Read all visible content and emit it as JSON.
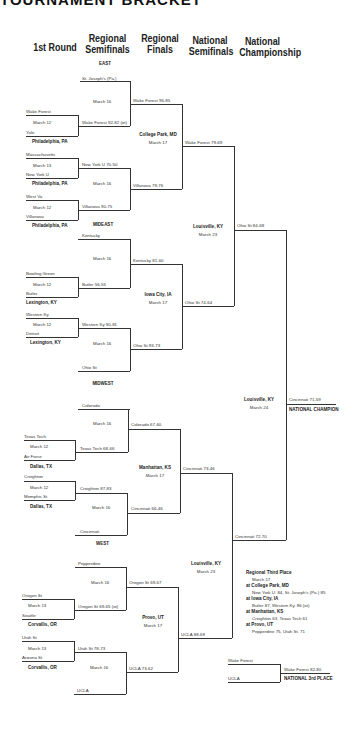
{
  "title": "TOURNAMENT BRACKET",
  "columns": [
    "1st Round",
    "Regional Semifinals",
    "Regional Finals",
    "National Semifinals",
    "National Championship"
  ],
  "regions": {
    "east": "EAST",
    "mideast": "MIDEAST",
    "midwest": "MIDWEST",
    "west": "WEST"
  },
  "first_round": [
    {
      "team1": "Wake Forest",
      "team2": "Yale",
      "date": "March 12",
      "site": "Philadelphia, PA"
    },
    {
      "team1": "Massachusetts",
      "team2": "New York U",
      "date": "March 13",
      "site": "Philadelphia, PA"
    },
    {
      "team1": "West Va",
      "team2": "Villanova",
      "date": "March 12",
      "site": "Philadelphia, PA"
    },
    {
      "team1": "Bowling Green",
      "team2": "Butler",
      "date": "March 12",
      "site": "Lexington, KY"
    },
    {
      "team1": "Western Ky",
      "team2": "Detroit",
      "date": "March 12",
      "site": "Lexington, KY"
    },
    {
      "team1": "Texas Tech",
      "team2": "Air Force",
      "date": "March 12",
      "site": "Dallas, TX"
    },
    {
      "team1": "Creighton",
      "team2": "Memphis St",
      "date": "March 12",
      "site": "Dallas, TX"
    },
    {
      "team1": "Oregon St",
      "team2": "Seattle",
      "date": "March 13",
      "site": "Corvallis, OR"
    },
    {
      "team1": "Utah St",
      "team2": "Arizona St",
      "date": "March 13",
      "site": "Corvallis, OR"
    }
  ],
  "regional_semis": {
    "byes": [
      "St. Joseph's (Pa.)",
      "Kentucky",
      "Ohio St",
      "Colorado",
      "Cincinnati",
      "Pepperdine",
      "UCLA"
    ],
    "winners_r1": [
      "Wake Forest 92-82 (ot)",
      "New York U 70-50",
      "Villanova 90-75",
      "Butler 56-55",
      "Western Ky 90-81",
      "Texas Tech 68-66",
      "Creighton 87-83",
      "Oregon St 69-65 (ot)",
      "Utah St 78-73"
    ],
    "dates": [
      "March 16",
      "March 16",
      "March 16",
      "March 16",
      "March 16",
      "March 16",
      "March 16",
      "March 16"
    ]
  },
  "regional_finals": {
    "winners": [
      "Wake Forest 96-85",
      "Villanova 79-76",
      "Kentucky 81-60",
      "Ohio St 93-73",
      "Colorado 67-60",
      "Cincinnati 66-46",
      "Oregon St 69-67",
      "UCLA 73-62"
    ],
    "sites": [
      {
        "site": "College Park, MD",
        "date": "March 17"
      },
      {
        "site": "Iowa City, IA",
        "date": "March 17"
      },
      {
        "site": "Manhattan, KS",
        "date": "March 17"
      },
      {
        "site": "Provo, UT",
        "date": "March 17"
      }
    ]
  },
  "national_semis": {
    "winners": [
      "Wake Forest 79-69",
      "Ohio St 74-64",
      "Cincinnati 73-46",
      "UCLA 88-69"
    ],
    "sites": [
      {
        "site": "Louisville, KY",
        "date": "March 23"
      },
      {
        "site": "Louisville, KY",
        "date": "March 23"
      }
    ]
  },
  "championship": {
    "finalists": [
      "Ohio St 84-68",
      "Cincinnati 72-70"
    ],
    "site": "Louisville, KY",
    "date": "March 24",
    "winner": "Cincinnati 71-59",
    "label": "NATIONAL CHAMPION"
  },
  "third_place_regional": {
    "heading": "Regional Third Place",
    "date": "March 17",
    "games": [
      {
        "site": "at College Park, MD",
        "result": "New York U. 84, St. Joseph's (Pa.) 85"
      },
      {
        "site": "at Iowa City, IA",
        "result": "Butler 87, Western Ky. 86 (ot)"
      },
      {
        "site": "at Manhattan, KS",
        "result": "Creighton 63, Texas Tech 61"
      },
      {
        "site": "at Provo, UT",
        "result": "Pepperdine 75, Utah St. 71"
      }
    ]
  },
  "national_third": {
    "team1": "Wake Forest",
    "team2": "UCLA",
    "winner": "Wake Forest 82-80",
    "label": "NATIONAL 3rd PLACE"
  }
}
